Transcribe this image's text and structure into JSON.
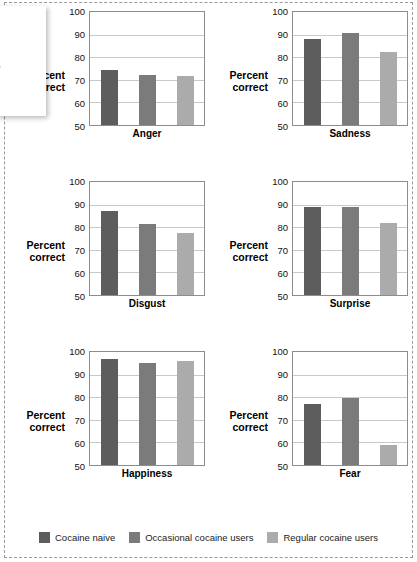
{
  "chart_data": {
    "type": "bar",
    "title": "",
    "ylabel": "Percent correct",
    "xlabel": "",
    "ylim": [
      50,
      100
    ],
    "yticks": [
      50,
      60,
      70,
      80,
      90,
      100
    ],
    "grid": true,
    "legend_position": "bottom",
    "categories": [
      "Anger",
      "Sadness",
      "Disgust",
      "Surprise",
      "Happiness",
      "Fear"
    ],
    "series": [
      {
        "name": "Cocaine naive",
        "color": "#5d5d5d",
        "values": [
          74.5,
          88.0,
          87.0,
          89.0,
          97.0,
          76.8
        ]
      },
      {
        "name": "Occasional cocaine users",
        "color": "#7b7b7b",
        "values": [
          72.0,
          90.5,
          81.5,
          89.0,
          95.0,
          79.5
        ]
      },
      {
        "name": "Regular cocaine users",
        "color": "#ababab",
        "values": [
          71.5,
          82.5,
          77.5,
          82.0,
          96.0,
          58.7
        ]
      }
    ]
  },
  "panels": [
    {
      "label": "Anger",
      "ylabel_line1": "Percent",
      "ylabel_line2": "correct"
    },
    {
      "label": "Sadness",
      "ylabel_line1": "Percent",
      "ylabel_line2": "correct"
    },
    {
      "label": "Disgust",
      "ylabel_line1": "Percent",
      "ylabel_line2": "correct"
    },
    {
      "label": "Surprise",
      "ylabel_line1": "Percent",
      "ylabel_line2": "correct"
    },
    {
      "label": "Happiness",
      "ylabel_line1": "Percent",
      "ylabel_line2": "correct"
    },
    {
      "label": "Fear",
      "ylabel_line1": "Percent",
      "ylabel_line2": "correct"
    }
  ],
  "axis": {
    "tick_100": "100",
    "tick_90": "90",
    "tick_80": "80",
    "tick_70": "70",
    "tick_60": "60",
    "tick_50": "50"
  },
  "legend": {
    "items": [
      {
        "label": "Cocaine naive",
        "color": "#5d5d5d"
      },
      {
        "label": "Occasional cocaine users",
        "color": "#7b7b7b"
      },
      {
        "label": "Regular cocaine users",
        "color": "#ababab"
      }
    ]
  },
  "overlay": {
    "mark_1": "|",
    "mark_2": "/"
  }
}
